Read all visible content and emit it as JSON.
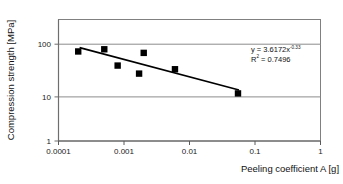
{
  "chart_data": {
    "type": "scatter",
    "title": "",
    "xlabel": "Peeling coefficient A [g]",
    "ylabel": "Compression strength [MPa]",
    "xscale": "log",
    "yscale": "log",
    "xlim": [
      0.0001,
      1
    ],
    "ylim": [
      1,
      300
    ],
    "grid": true,
    "grid_axis": "y",
    "legend": "none",
    "xticks": [
      "0.0001",
      "0.001",
      "0.01",
      "0.1",
      "1"
    ],
    "xtick_values": [
      0.0001,
      0.001,
      0.01,
      0.1,
      1
    ],
    "yticks": [
      "1",
      "10",
      "100"
    ],
    "ytick_values": [
      1,
      10,
      100
    ],
    "series": [
      {
        "name": "Measurements",
        "marker": "square",
        "marker_color": "#000000",
        "points": [
          {
            "x": 0.0002,
            "y": 50
          },
          {
            "x": 0.0005,
            "y": 55
          },
          {
            "x": 0.0008,
            "y": 27
          },
          {
            "x": 0.0017,
            "y": 19
          },
          {
            "x": 0.002,
            "y": 47
          },
          {
            "x": 0.006,
            "y": 23
          },
          {
            "x": 0.055,
            "y": 8
          }
        ]
      }
    ],
    "trendline": {
      "type": "power",
      "coefficient": 3.6172,
      "exponent": -0.33,
      "r_squared": 0.7496,
      "color": "#000000",
      "x_start": 0.00021,
      "x_end": 0.057
    },
    "annotations": {
      "equation_base": "y = 3.6172x",
      "equation_exponent": "-0.33",
      "r_squared_label": "R",
      "r_squared_sup": "2",
      "r_squared_value": " = 0.7496"
    }
  },
  "axes": {
    "x_title": "Peeling coefficient A [g]",
    "y_title": "Compression strength [MPa]",
    "x_tick_labels": [
      "0.0001",
      "0.001",
      "0.01",
      "0.1",
      "1"
    ],
    "y_tick_labels": [
      "100",
      "10",
      "1"
    ]
  },
  "colors": {
    "marker": "#000000",
    "trendline": "#000000",
    "gridline": "#8c8c8c",
    "frame": "#7a7a7a",
    "background": "#ffffff",
    "text": "#111111"
  }
}
